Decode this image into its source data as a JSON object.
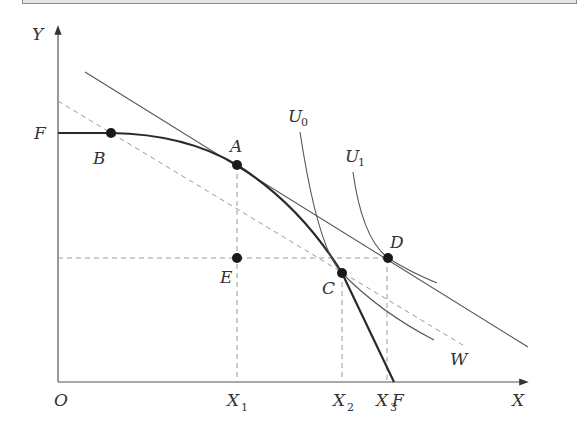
{
  "diagram": {
    "type": "production-possibility-frontier-with-indifference-curves",
    "axes": {
      "x_label": "X",
      "y_label": "Y",
      "origin_label": "O"
    },
    "curves": {
      "ppf_label_y": "F",
      "ppf_label_x": "F",
      "u0_label": "U",
      "u0_sub": "0",
      "u1_label": "U",
      "u1_sub": "1",
      "world_price_line_label": "W"
    },
    "points": {
      "a": "A",
      "b": "B",
      "c": "C",
      "d": "D",
      "e": "E"
    },
    "x_ticks": [
      {
        "label": "X",
        "sub": "1"
      },
      {
        "label": "X",
        "sub": "2"
      },
      {
        "label": "X",
        "sub": "3"
      }
    ],
    "colors": {
      "axis": "#555555",
      "ppf": "#2a2a2a",
      "line": "#555555",
      "dashed": "#9a9a9a",
      "point": "#1a1a1a"
    }
  }
}
